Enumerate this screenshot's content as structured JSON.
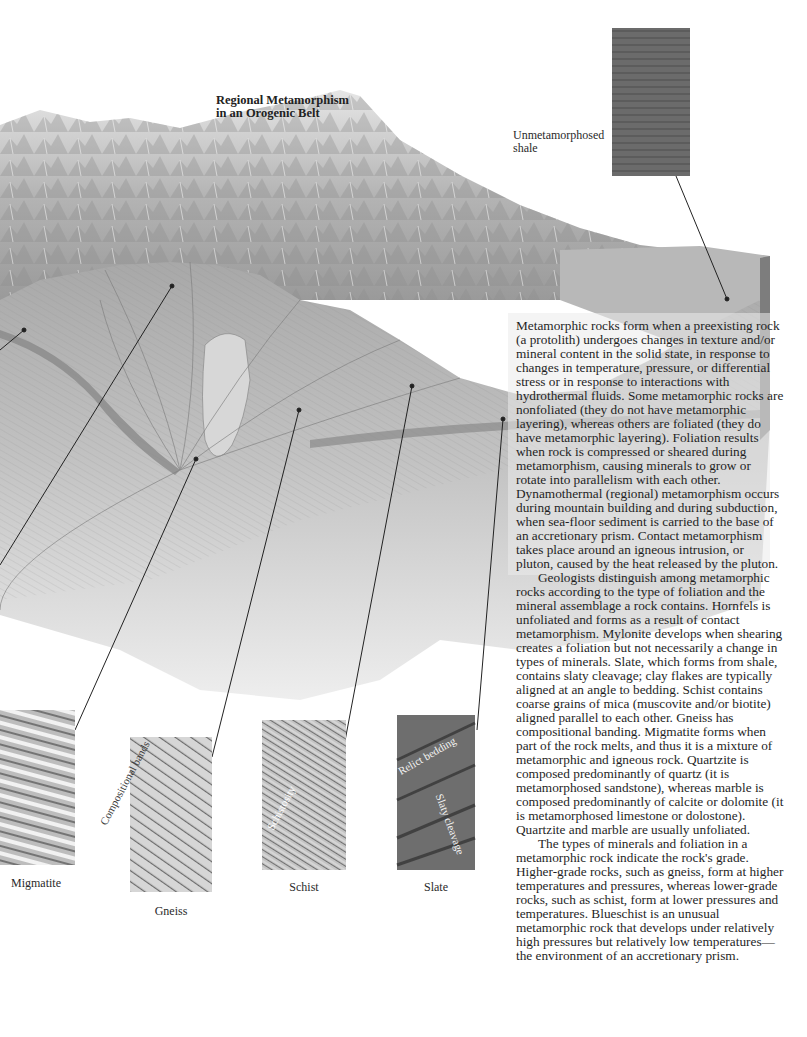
{
  "figure": {
    "title_line1": "Regional Metamorphism",
    "title_line2": "in an Orogenic Belt",
    "unmetamorphosed_label_line1": "Unmetamorphosed",
    "unmetamorphosed_label_line2": "shale",
    "samples": [
      {
        "name": "Migmatite"
      },
      {
        "name": "Gneiss",
        "inner_label": "Compositional bands"
      },
      {
        "name": "Schist",
        "inner_label": "Schistosity"
      },
      {
        "name": "Slate",
        "inner_labels": [
          "Relict bedding",
          "Slaty cleavage"
        ]
      }
    ],
    "colors": {
      "background": "#ffffff",
      "rock_dark": "#6e6e6e",
      "rock_mid": "#a9a9a9",
      "rock_light": "#d8d8d8",
      "leader_line": "#222222"
    }
  },
  "body_text": {
    "paragraphs": [
      "Metamorphic rocks form when a preexisting rock (a protolith) undergoes changes in texture and/or mineral content in the solid state, in response to changes in temperature, pressure, or differential stress or in response to interactions with hydrothermal fluids. Some metamorphic rocks are nonfoliated (they do not have metamorphic layering), whereas others are foliated (they do have metamorphic layering). Foliation results when rock is compressed or sheared during metamorphism, causing minerals to grow or rotate into parallelism with each other. Dynamothermal (regional) metamorphism occurs during mountain building and during subduction, when sea-floor sediment is carried to the base of an accretionary prism. Contact metamorphism takes place around an igneous intrusion, or pluton, caused by the heat released by the pluton.",
      "Geologists distinguish among metamorphic rocks according to the type of foliation and the mineral assemblage a rock contains. Hornfels is unfoliated and forms as a result of contact metamorphism. Mylonite develops when shearing creates a foliation but not necessarily a change in types of minerals. Slate, which forms from shale, contains slaty cleavage; clay flakes are typically aligned at an angle to bedding. Schist contains coarse grains of mica (muscovite and/or biotite) aligned parallel to each other. Gneiss has compositional banding. Migmatite forms when part of the rock melts, and thus it is a mixture of metamorphic and igneous rock. Quartzite is composed predominantly of quartz (it is metamorphosed sandstone), whereas marble is composed predominantly of calcite or dolomite (it is metamorphosed limestone or dolostone). Quartzite and marble are usually unfoliated.",
      "The types of minerals and foliation in a metamorphic rock indicate the rock's grade. Higher-grade rocks, such as gneiss, form at higher temperatures and pressures, whereas lower-grade rocks, such as schist, form at lower pressures and temperatures. Blueschist is an unusual metamorphic rock that develops under relatively high pressures but relatively low temperatures—the environment of an accretionary prism."
    ]
  }
}
